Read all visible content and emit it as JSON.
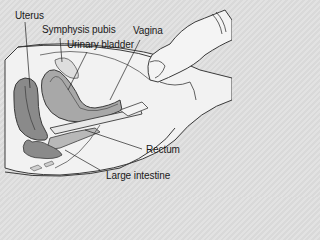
{
  "diagram": {
    "labels": {
      "uterus": "Uterus",
      "symphysis_pubis": "Symphysis pubis",
      "urinary_bladder": "Urinary bladder",
      "vagina": "Vagina",
      "rectum": "Rectum",
      "large_intestine": "Large intestine"
    },
    "colors": {
      "background": "#dcdcdc",
      "body_fill": "#f2f2f2",
      "organ_dark": "#8a8a8a",
      "organ_mid": "#a8a8a8",
      "organ_light": "#c8c8c8",
      "outline": "#3a3a3a",
      "glove": "#f4f4f4"
    }
  }
}
